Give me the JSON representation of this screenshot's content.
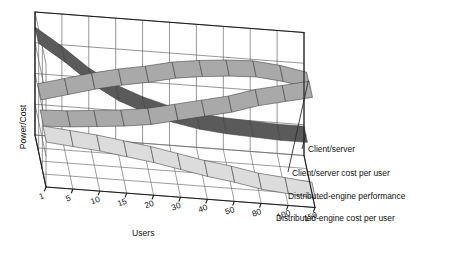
{
  "chart_data": {
    "type": "area",
    "title": "",
    "xlabel": "Users",
    "ylabel": "Power/Cost",
    "zlabel": "",
    "grid": true,
    "legend_position": "right",
    "projection": "3d-ribbon",
    "categories": [
      "1",
      "5",
      "10",
      "15",
      "20",
      "30",
      "40",
      "50",
      "80",
      "100",
      "150"
    ],
    "xtick_labels": [
      "1",
      "5",
      "10",
      "15",
      "20",
      "30",
      "40",
      "50",
      "80",
      "100",
      "150"
    ],
    "ylim": [
      0,
      100
    ],
    "yaxis_ticks_visible": false,
    "series": [
      {
        "name": "Client/server",
        "color": "#5a5a5a",
        "depth_row": 0,
        "values": [
          88,
          74,
          58,
          46,
          38,
          32,
          28,
          26,
          25,
          24,
          24
        ]
      },
      {
        "name": "Client/server cost per user",
        "color": "#a9a9a9",
        "depth_row": 1,
        "values": [
          52,
          58,
          64,
          69,
          73,
          78,
          81,
          83,
          84,
          82,
          78
        ]
      },
      {
        "name": "Distributed-engine performance",
        "color": "#a9a9a9",
        "depth_row": 2,
        "values": [
          40,
          41,
          43,
          45,
          48,
          53,
          58,
          63,
          70,
          75,
          80
        ]
      },
      {
        "name": "Distributed-engine cost per user",
        "color": "#dcdcdc",
        "depth_row": 3,
        "values": [
          38,
          36,
          34,
          31,
          28,
          24,
          20,
          17,
          13,
          11,
          9
        ]
      }
    ],
    "legend_entries": [
      "Client/server",
      "Client/server cost per user",
      "Distributed-engine performance",
      "Distributed-engine cost per user"
    ],
    "colors": {
      "dark_ribbon": "#5a5a5a",
      "mid_ribbon": "#a9a9a9",
      "light_ribbon": "#dcdcdc",
      "axis": "#1b1b1b",
      "grid": "#5f5f5f",
      "background": "#ffffff"
    }
  },
  "axes": {
    "y_title": "Power/Cost",
    "x_title": "Users"
  },
  "legend": {
    "items": [
      {
        "label": "Client/server"
      },
      {
        "label": "Client/server cost per user"
      },
      {
        "label": "Distributed-engine performance"
      },
      {
        "label": "Distributed-engine cost per user"
      }
    ]
  }
}
